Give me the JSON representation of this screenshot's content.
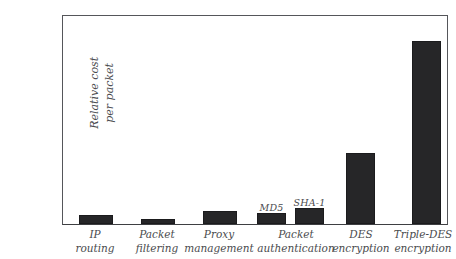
{
  "chart_data": {
    "type": "bar",
    "title": "",
    "subtitle": "",
    "xlabel": "",
    "ylabel": "Relative cost per packet",
    "ylabel_lines": [
      "Relative cost",
      "per packet"
    ],
    "ylim": [
      0,
      110
    ],
    "yticks": [
      10,
      20,
      30,
      40,
      50,
      60,
      70,
      80,
      90,
      100
    ],
    "ytick_labels": [
      "10",
      "20",
      "30",
      "40",
      "50",
      "60",
      "70",
      "80",
      "90",
      "100"
    ],
    "grid": false,
    "legend": false,
    "legend_position": "none",
    "bar_color": "#262628",
    "axis_color": "#55565a",
    "background_color": "#ffffff",
    "categories": [
      "IP routing",
      "Packet filtering",
      "Proxy management",
      "Packet authentication",
      "DES encryption",
      "Triple-DES encryption"
    ],
    "category_label_lines": [
      [
        "IP",
        "routing"
      ],
      [
        "Packet",
        "filtering"
      ],
      [
        "Proxy",
        "management"
      ],
      [
        "Packet",
        "authentication"
      ],
      [
        "DES",
        "encryption"
      ],
      [
        "Triple-DES",
        "encryption"
      ]
    ],
    "values": [
      5,
      3,
      7,
      null,
      39,
      101
    ],
    "bars": [
      {
        "label": "IP routing",
        "annotation": "",
        "value": 5,
        "x": 78,
        "width": 34
      },
      {
        "label": "Packet filtering",
        "annotation": "",
        "value": 3,
        "x": 140,
        "width": 34
      },
      {
        "label": "Proxy management",
        "annotation": "",
        "value": 7,
        "x": 202,
        "width": 34
      },
      {
        "label": "MD5",
        "annotation": "MD5",
        "value": 6,
        "x": 256,
        "width": 29
      },
      {
        "label": "SHA-1",
        "annotation": "SHA-1",
        "value": 9,
        "x": 294,
        "width": 29
      },
      {
        "label": "DES encryption",
        "annotation": "",
        "value": 39,
        "x": 345,
        "width": 29
      },
      {
        "label": "Triple-DES encryption",
        "annotation": "",
        "value": 101,
        "x": 411,
        "width": 29
      }
    ],
    "annotations": [
      "MD5",
      "SHA-1"
    ]
  }
}
